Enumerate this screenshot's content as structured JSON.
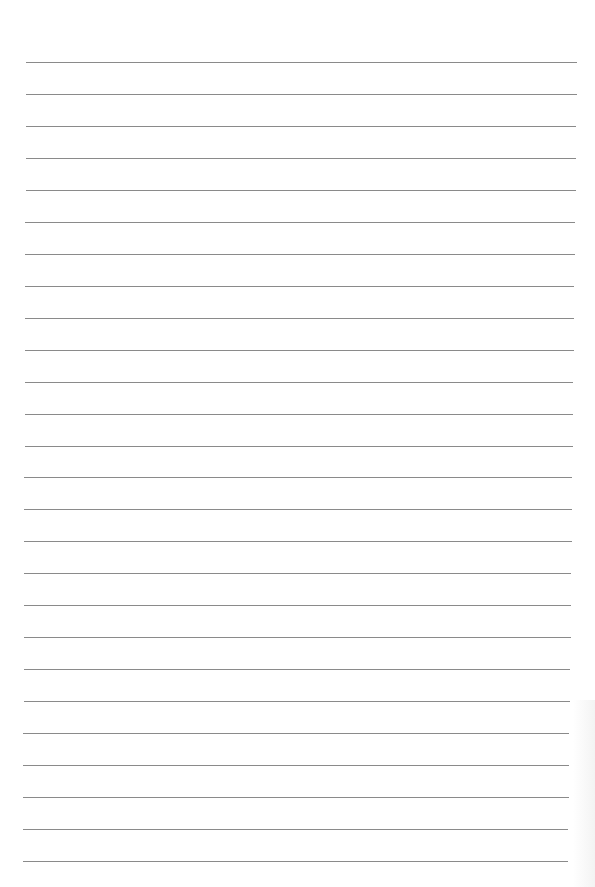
{
  "page": {
    "type": "lined-paper",
    "background_color": "#ffffff",
    "rule_color": "#8a8a8a",
    "rule_count": 26,
    "first_rule_y": 62,
    "rule_spacing": 31.96,
    "rule_left_top": 26,
    "rule_left_bottom": 23,
    "rule_right_top": 577,
    "rule_right_bottom": 568
  }
}
